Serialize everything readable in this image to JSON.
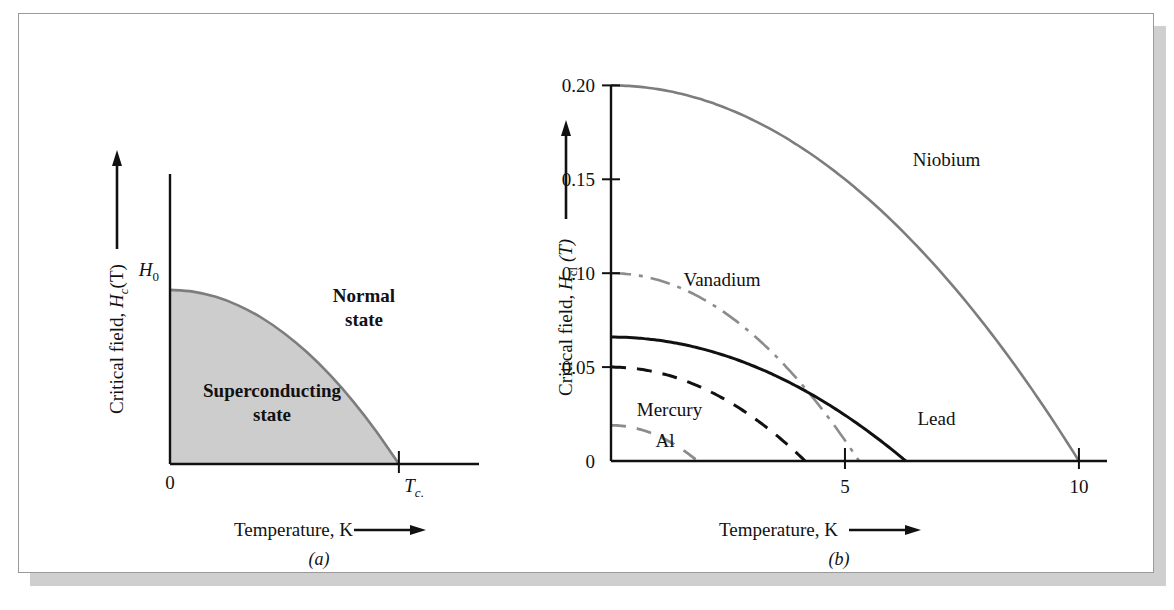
{
  "figure": {
    "panel_a_letter": "(a)",
    "panel_b_letter": "(b)"
  },
  "panel_a": {
    "y_axis_title_prefix": "Critical field, ",
    "y_axis_symbol": "H",
    "y_axis_sub": "c",
    "y_axis_suffix": "(T)",
    "x_axis_title": "Temperature, K",
    "y_origin_label": "0",
    "y_top_label": "H",
    "y_top_sub": "0",
    "x_tc_label": "T",
    "x_tc_sub": "c",
    "x_tc_period": ".",
    "region_sc_line1": "Superconducting",
    "region_sc_line2": "state",
    "region_normal_line1": "Normal",
    "region_normal_line2": "state",
    "fill_color": "#cdcdcd"
  },
  "panel_b": {
    "y_axis_title_prefix": "Critical field, ",
    "y_axis_symbol": "H",
    "y_axis_sub": "cl",
    "y_axis_suffix": "(T)",
    "x_axis_title": "Temperature, K"
  },
  "chart_data": [
    {
      "type": "area",
      "title": "Critical field phase diagram (schematic)",
      "xlabel": "Temperature, K",
      "ylabel": "Critical field, Hc(T)",
      "xlim": [
        0,
        1.35
      ],
      "ylim": [
        0,
        1.12
      ],
      "grid": false,
      "legend": "none",
      "annotations": [
        {
          "text": "Superconducting state",
          "x": 0.33,
          "y": 0.34
        },
        {
          "text": "Normal state",
          "x": 0.8,
          "y": 0.78
        }
      ],
      "xticks": [
        {
          "value": 0,
          "label": "0"
        },
        {
          "value": 1.0,
          "label": "Tc."
        }
      ],
      "yticks": [
        {
          "value": 1.0,
          "label": "H0"
        }
      ],
      "series": [
        {
          "name": "Hc(T) boundary",
          "style": "solid",
          "color": "#7d7d7d",
          "x": [
            0,
            0.1,
            0.2,
            0.3,
            0.4,
            0.5,
            0.6,
            0.7,
            0.8,
            0.9,
            1.0
          ],
          "values": [
            1.0,
            0.99,
            0.96,
            0.91,
            0.84,
            0.75,
            0.64,
            0.51,
            0.36,
            0.19,
            0.0
          ]
        }
      ]
    },
    {
      "type": "line",
      "title": "Critical field vs temperature for superconducting elements",
      "xlabel": "Temperature, K",
      "ylabel": "Critical field, Hcl (T)",
      "xlim": [
        0,
        10.6
      ],
      "ylim": [
        0,
        0.205
      ],
      "grid": false,
      "legend": "inline-labels",
      "xticks": [
        {
          "value": 0,
          "label": "0"
        },
        {
          "value": 5,
          "label": "5"
        },
        {
          "value": 10,
          "label": "10"
        }
      ],
      "yticks": [
        {
          "value": 0,
          "label": "0"
        },
        {
          "value": 0.05,
          "label": "0.05"
        },
        {
          "value": 0.1,
          "label": "0.10"
        },
        {
          "value": 0.15,
          "label": "0.15"
        },
        {
          "value": 0.2,
          "label": "0.20"
        }
      ],
      "series": [
        {
          "name": "Niobium",
          "label": "Niobium",
          "style": "solid",
          "color": "#7d7d7d",
          "width": 2.6,
          "h0": 0.2,
          "tc": 10.0,
          "label_x": 6.45,
          "label_y": 0.157,
          "x": [
            0,
            1,
            2,
            3,
            4,
            5,
            6,
            7,
            8,
            9,
            10
          ],
          "values": [
            0.2,
            0.198,
            0.192,
            0.182,
            0.168,
            0.15,
            0.128,
            0.102,
            0.072,
            0.038,
            0.0
          ]
        },
        {
          "name": "Vanadium",
          "label": "Vanadium",
          "style": "dashdot",
          "color": "#8c8c8c",
          "width": 2.6,
          "h0": 0.1,
          "tc": 5.3,
          "label_x": 1.55,
          "label_y": 0.093,
          "x": [
            0,
            0.53,
            1.06,
            1.59,
            2.12,
            2.65,
            3.18,
            3.71,
            4.24,
            4.77,
            5.3
          ],
          "values": [
            0.1,
            0.099,
            0.096,
            0.091,
            0.084,
            0.075,
            0.064,
            0.051,
            0.036,
            0.019,
            0.0
          ]
        },
        {
          "name": "Lead",
          "label": "Lead",
          "style": "solid",
          "color": "#111111",
          "width": 3.0,
          "h0": 0.066,
          "tc": 6.3,
          "label_x": 6.55,
          "label_y": 0.019,
          "x": [
            0,
            0.63,
            1.26,
            1.89,
            2.52,
            3.15,
            3.78,
            4.41,
            5.04,
            5.67,
            6.3
          ],
          "values": [
            0.066,
            0.065,
            0.063,
            0.06,
            0.055,
            0.05,
            0.042,
            0.034,
            0.024,
            0.013,
            0.0
          ]
        },
        {
          "name": "Mercury",
          "label": "Mercury",
          "style": "dashed",
          "color": "#111111",
          "width": 3.0,
          "h0": 0.05,
          "tc": 4.15,
          "label_x": 0.55,
          "label_y": 0.024,
          "x": [
            0,
            0.415,
            0.83,
            1.245,
            1.66,
            2.075,
            2.49,
            2.905,
            3.32,
            3.735,
            4.15
          ],
          "values": [
            0.05,
            0.0495,
            0.048,
            0.0455,
            0.042,
            0.0375,
            0.032,
            0.0255,
            0.018,
            0.0095,
            0.0
          ]
        },
        {
          "name": "Al",
          "label": "Al",
          "style": "dashed",
          "color": "#8c8c8c",
          "width": 2.8,
          "h0": 0.019,
          "tc": 1.85,
          "label_x": 0.95,
          "label_y": 0.0075,
          "x": [
            0,
            0.185,
            0.37,
            0.555,
            0.74,
            0.925,
            1.11,
            1.295,
            1.48,
            1.665,
            1.85
          ],
          "values": [
            0.019,
            0.0188,
            0.0182,
            0.0173,
            0.016,
            0.0143,
            0.0122,
            0.0097,
            0.0068,
            0.0036,
            0.0
          ]
        }
      ]
    }
  ]
}
